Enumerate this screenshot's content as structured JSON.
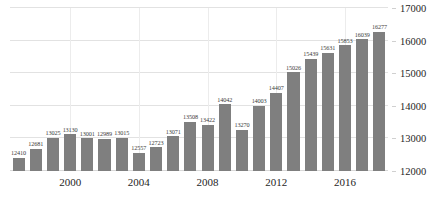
{
  "chart_data": {
    "type": "bar",
    "title": "",
    "subtitle": "",
    "xlabel": "",
    "ylabel": "",
    "grid": true,
    "legend": null,
    "ylim": [
      12000,
      17000
    ],
    "y_ticks": [
      12000,
      13000,
      14000,
      15000,
      16000,
      17000
    ],
    "y_axis_position": "right",
    "x_tick_labels": [
      "2000",
      "2004",
      "2008",
      "2012",
      "2016"
    ],
    "x_tick_categories": [
      "2000",
      "2004",
      "2008",
      "2012",
      "2016"
    ],
    "bar_color": "#7f7f7f",
    "gridline_color": "#e2e2e2",
    "label_color": "#3c3c3c",
    "categories": [
      "1997",
      "1998",
      "1999",
      "2000",
      "2001",
      "2002",
      "2003",
      "2004",
      "2005",
      "2006",
      "2007",
      "2008",
      "2009",
      "2010",
      "2011",
      "2012",
      "2013",
      "2014",
      "2015",
      "2016",
      "2017",
      "2018"
    ],
    "values": [
      12410,
      12681,
      13025,
      13130,
      13001,
      12989,
      13015,
      12557,
      12723,
      13071,
      13508,
      13422,
      14042,
      13270,
      14003,
      14407,
      15026,
      15439,
      15631,
      15853,
      16039,
      16277
    ],
    "data_labels": [
      "12410",
      "12681",
      "13025",
      "13130",
      "13001",
      "12989",
      "13015",
      "12557",
      "12723",
      "13071",
      "13508",
      "13422",
      "14042",
      "13270",
      "14003",
      "14407",
      "15026",
      "15439",
      "15631",
      "15853",
      "16039",
      "16277"
    ]
  }
}
